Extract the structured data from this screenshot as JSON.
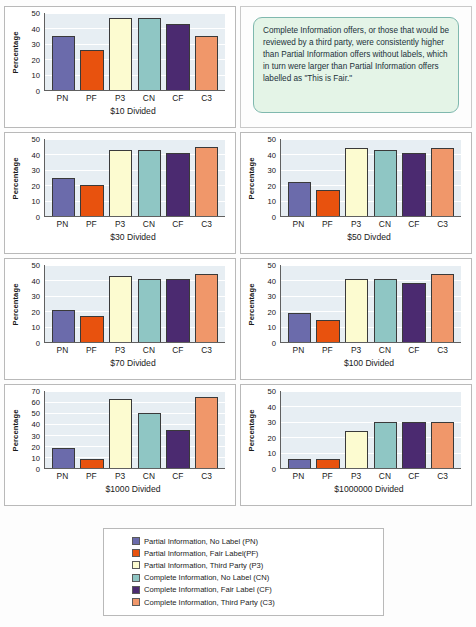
{
  "callout": {
    "text": "Complete Information offers, or those that would be reviewed by a third party, were consistently higher than Partial Information offers without labels, which in turn were larger than Partial Information offers labelled as \"This is Fair.\"",
    "background": "#e4f4e7",
    "border": "#7fb8ae"
  },
  "series_colors": {
    "PN": "#6b6bab",
    "PF": "#e8520e",
    "P3": "#fcfbd0",
    "CN": "#8fc6c4",
    "CF": "#4b2a70",
    "C3": "#f0976a"
  },
  "legend": {
    "items": [
      {
        "label": "Partial Information, No Label (PN)",
        "color": "#6b6bab"
      },
      {
        "label": "Partial Information, Fair  Label(PF)",
        "color": "#e8520e"
      },
      {
        "label": "Partial Information, Third Party (P3)",
        "color": "#fcfbd0"
      },
      {
        "label": "Complete Information, No Label (CN)",
        "color": "#8fc6c4"
      },
      {
        "label": "Complete Information, Fair Label (CF)",
        "color": "#4b2a70"
      },
      {
        "label": "Complete Information, Third Party (C3)",
        "color": "#f0976a"
      }
    ]
  },
  "chart_data": [
    {
      "type": "bar",
      "title": "$10 Divided",
      "xlabel": "",
      "ylabel": "Percentage",
      "categories": [
        "PN",
        "PF",
        "P3",
        "CN",
        "CF",
        "C3"
      ],
      "values": [
        35,
        26,
        47,
        47,
        43,
        35
      ],
      "ylim": [
        0,
        50
      ],
      "yticks": [
        0,
        10,
        20,
        30,
        40,
        50
      ],
      "grid": true,
      "legend": "bottom"
    },
    {
      "type": "bar",
      "title": "$30 Divided",
      "xlabel": "",
      "ylabel": "Percentage",
      "categories": [
        "PN",
        "PF",
        "P3",
        "CN",
        "CF",
        "C3"
      ],
      "values": [
        25,
        20,
        43,
        43,
        41,
        45
      ],
      "ylim": [
        0,
        50
      ],
      "yticks": [
        0,
        10,
        20,
        30,
        40,
        50
      ],
      "grid": true,
      "legend": "bottom"
    },
    {
      "type": "bar",
      "title": "$50 Divded",
      "xlabel": "",
      "ylabel": "Percentage",
      "categories": [
        "PN",
        "PF",
        "P3",
        "CN",
        "CF",
        "C3"
      ],
      "values": [
        22,
        17,
        44,
        43,
        41,
        44
      ],
      "ylim": [
        0,
        50
      ],
      "yticks": [
        0,
        10,
        20,
        30,
        40,
        50
      ],
      "grid": true,
      "legend": "bottom"
    },
    {
      "type": "bar",
      "title": "$70 Divided",
      "xlabel": "",
      "ylabel": "Percentage",
      "categories": [
        "PN",
        "PF",
        "P3",
        "CN",
        "CF",
        "C3"
      ],
      "values": [
        21,
        17,
        43,
        41,
        41,
        44
      ],
      "ylim": [
        0,
        50
      ],
      "yticks": [
        0,
        10,
        20,
        30,
        40,
        50
      ],
      "grid": true,
      "legend": "bottom"
    },
    {
      "type": "bar",
      "title": "$100 Divided",
      "xlabel": "",
      "ylabel": "Percentage",
      "categories": [
        "PN",
        "PF",
        "P3",
        "CN",
        "CF",
        "C3"
      ],
      "values": [
        19,
        14.5,
        41,
        41,
        38,
        44
      ],
      "ylim": [
        0,
        50
      ],
      "yticks": [
        0,
        10,
        20,
        30,
        40,
        50
      ],
      "grid": true,
      "legend": "bottom"
    },
    {
      "type": "bar",
      "title": "$1000 Divided",
      "xlabel": "",
      "ylabel": "Percentage",
      "categories": [
        "PN",
        "PF",
        "P3",
        "CN",
        "CF",
        "C3"
      ],
      "values": [
        18,
        8,
        63,
        50,
        35,
        65
      ],
      "ylim": [
        0,
        70
      ],
      "yticks": [
        0,
        10,
        20,
        30,
        40,
        50,
        60,
        70
      ],
      "grid": true,
      "legend": "bottom"
    },
    {
      "type": "bar",
      "title": "$1000000 Divided",
      "xlabel": "",
      "ylabel": "Percentage",
      "categories": [
        "PN",
        "PF",
        "P3",
        "CN",
        "CF",
        "C3"
      ],
      "values": [
        6,
        6,
        24,
        30,
        30,
        30
      ],
      "ylim": [
        0,
        50
      ],
      "yticks": [
        0,
        10,
        20,
        30,
        40,
        50
      ],
      "grid": true,
      "legend": "bottom"
    }
  ]
}
